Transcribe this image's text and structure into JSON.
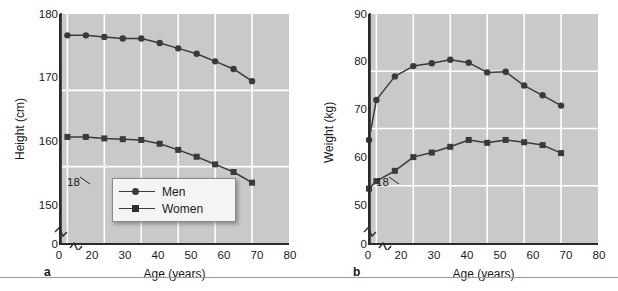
{
  "figure": {
    "background_color": "#ffffff",
    "plot_background_color": "#c9c9c9",
    "gridline_color": "#ffffff",
    "series_color": "#3a3a3a",
    "axis_color": "#2b2b2b"
  },
  "panels": [
    {
      "letter": "a",
      "ylabel": "Height (cm)",
      "xlabel": "Age (years)",
      "annotation": "18",
      "y_ticks": [
        "180",
        "170",
        "160",
        "150",
        "0"
      ],
      "x_ticks": [
        "0",
        "20",
        "30",
        "40",
        "50",
        "60",
        "70",
        "80"
      ],
      "legend": {
        "men_label": "Men",
        "women_label": "Women"
      }
    },
    {
      "letter": "b",
      "ylabel": "Weight (kg)",
      "xlabel": "Age (years)",
      "annotation": "18",
      "y_ticks": [
        "90",
        "80",
        "70",
        "60",
        "50",
        "0"
      ],
      "x_ticks": [
        "0",
        "20",
        "30",
        "40",
        "50",
        "60",
        "70",
        "80"
      ]
    }
  ],
  "chart_data": [
    {
      "type": "line",
      "panel": "a",
      "title": "",
      "xlabel": "Age (years)",
      "ylabel": "Height (cm)",
      "xlim": [
        18,
        80
      ],
      "ylim": [
        150,
        180
      ],
      "x_ticks": [
        20,
        30,
        40,
        50,
        60,
        70,
        80
      ],
      "y_ticks": [
        150,
        160,
        170,
        180
      ],
      "grid": true,
      "axis_break": true,
      "reference_line_x": 18,
      "reference_line_label": "18",
      "legend": [
        "Men",
        "Women"
      ],
      "legend_position": "lower-center",
      "series": [
        {
          "name": "Men",
          "marker": "circle",
          "x": [
            20,
            25,
            30,
            35,
            40,
            45,
            50,
            55,
            60,
            65,
            70
          ],
          "values": [
            177.2,
            177.2,
            177.0,
            176.8,
            176.8,
            176.2,
            175.5,
            174.8,
            173.8,
            172.8,
            171.2
          ]
        },
        {
          "name": "Women",
          "marker": "square",
          "x": [
            20,
            25,
            30,
            35,
            40,
            45,
            50,
            55,
            60,
            65,
            70
          ],
          "values": [
            163.9,
            163.9,
            163.7,
            163.6,
            163.5,
            163.0,
            162.2,
            161.3,
            160.3,
            159.3,
            157.9
          ]
        }
      ]
    },
    {
      "type": "line",
      "panel": "b",
      "title": "",
      "xlabel": "Age (years)",
      "ylabel": "Weight (kg)",
      "xlim": [
        18,
        80
      ],
      "ylim": [
        50,
        90
      ],
      "x_ticks": [
        20,
        30,
        40,
        50,
        60,
        70,
        80
      ],
      "y_ticks": [
        50,
        60,
        70,
        80,
        90
      ],
      "grid": true,
      "axis_break": true,
      "reference_line_x": 18,
      "reference_line_label": "18",
      "legend": [
        "Men",
        "Women"
      ],
      "legend_position": "none",
      "series": [
        {
          "name": "Men",
          "marker": "circle",
          "x": [
            18,
            20,
            25,
            30,
            35,
            40,
            45,
            50,
            55,
            60,
            65,
            70
          ],
          "values": [
            68.0,
            75.0,
            79.1,
            80.9,
            81.4,
            82.0,
            81.5,
            79.8,
            79.9,
            77.5,
            75.8,
            74.0
          ]
        },
        {
          "name": "Women",
          "marker": "square",
          "x": [
            18,
            20,
            25,
            30,
            35,
            40,
            45,
            50,
            55,
            60,
            65,
            70
          ],
          "values": [
            59.5,
            60.8,
            62.6,
            65.0,
            65.8,
            66.8,
            68.0,
            67.5,
            68.0,
            67.6,
            67.1,
            65.7
          ]
        }
      ]
    }
  ]
}
